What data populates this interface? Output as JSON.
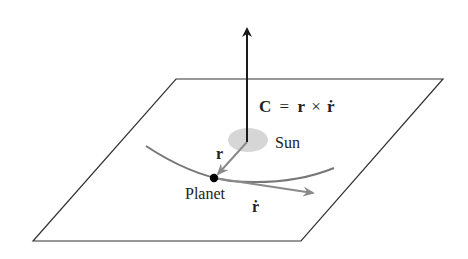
{
  "diagram": {
    "type": "physics-vector-diagram",
    "labels": {
      "equation": "C = r × ṙ",
      "equation_parts": {
        "lhs": "C",
        "eq": "=",
        "r": "r",
        "cross": "×",
        "rdot": "ṙ"
      },
      "sun": "Sun",
      "planet": "Planet",
      "position_vector": "r",
      "velocity_vector": "ṙ"
    },
    "elements": {
      "plane": {
        "corners": [
          [
            176,
            79
          ],
          [
            443,
            79
          ],
          [
            301,
            241
          ],
          [
            33,
            241
          ]
        ],
        "stroke": "#333333"
      },
      "c_vector": {
        "from": [
          247,
          142
        ],
        "to": [
          247,
          27
        ],
        "color": "#1a1a1a"
      },
      "sun": {
        "center": [
          248,
          140
        ],
        "rx": 20,
        "ry": 12,
        "color": "#d6d6d6"
      },
      "orbit": {
        "color": "#777777"
      },
      "r_vector": {
        "from": [
          247,
          142
        ],
        "to": [
          215,
          177
        ],
        "color": "#8a8a8a"
      },
      "velocity_vector": {
        "from": [
          214,
          178
        ],
        "to": [
          315,
          193
        ],
        "color": "#8a8a8a"
      },
      "planet": {
        "center": [
          214,
          178
        ],
        "r": 4,
        "color": "#000000"
      }
    }
  }
}
